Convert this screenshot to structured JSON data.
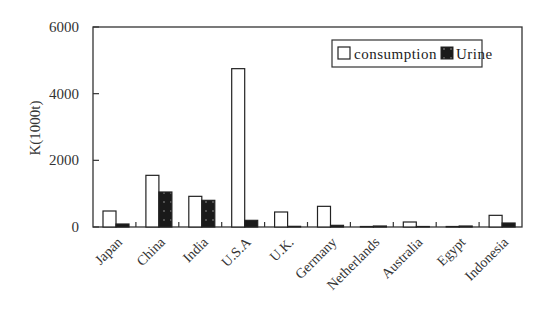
{
  "chart_data": {
    "type": "bar",
    "title": "",
    "xlabel": "",
    "ylabel": "K(1000t)",
    "ylim": [
      0,
      6000
    ],
    "yticks": [
      0,
      2000,
      4000,
      6000
    ],
    "grid": false,
    "legend_position": "top-right inside",
    "categories": [
      "Japan",
      "China",
      "India",
      "U.S.A",
      "U.K.",
      "Germany",
      "Netherlands",
      "Australia",
      "Egypt",
      "Indonesia"
    ],
    "series": [
      {
        "name": "consumption",
        "color": "#ffffff",
        "values": [
          480,
          1550,
          920,
          4750,
          450,
          620,
          10,
          150,
          10,
          350
        ]
      },
      {
        "name": "Urine",
        "color": "#1a1a1a",
        "values": [
          90,
          1050,
          800,
          200,
          20,
          50,
          30,
          10,
          30,
          120
        ]
      }
    ]
  }
}
